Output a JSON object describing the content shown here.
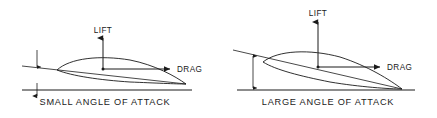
{
  "figure": {
    "background_color": "#ffffff",
    "ink_color": "#1a1a1a",
    "width": 437,
    "height": 118
  },
  "panels": [
    {
      "id": "small-angle",
      "caption": "SMALL ANGLE OF ATTACK",
      "lift_label": "LIFT",
      "drag_label": "DRAG",
      "angle_magnitude": "small",
      "airfoil": {
        "leading_edge": [
          57,
          70
        ],
        "trailing_edge": [
          186,
          84
        ],
        "chord_line_start": [
          22,
          66
        ],
        "chord_line_end": [
          186,
          84
        ],
        "upper_surface_path": "M57,70 C70,58 100,55 130,60 C155,65 175,76 186,84",
        "lower_surface_path": "M57,70 C72,76 100,80 130,82 C155,83 176,84 186,84"
      },
      "center_of_pressure": [
        103,
        69
      ],
      "lift_arrow": {
        "from": [
          103,
          69
        ],
        "to": [
          103,
          36
        ]
      },
      "drag_arrow": {
        "from": [
          103,
          69
        ],
        "to": [
          172,
          69
        ]
      },
      "reference_line": {
        "from": [
          22,
          90
        ],
        "to": [
          192,
          90
        ]
      },
      "angle_indicator": {
        "from": [
          37,
          52
        ],
        "to": [
          37,
          68
        ]
      },
      "caption_anchor": [
        105,
        104
      ],
      "lift_label_anchor": [
        103,
        32
      ],
      "drag_label_anchor": [
        176,
        71
      ]
    },
    {
      "id": "large-angle",
      "caption": "LARGE ANGLE OF ATTACK",
      "lift_label": "LIFT",
      "drag_label": "DRAG",
      "angle_magnitude": "large",
      "airfoil": {
        "leading_edge": [
          263,
          62
        ],
        "trailing_edge": [
          402,
          89
        ],
        "chord_line_start": [
          233,
          50
        ],
        "chord_line_end": [
          402,
          89
        ],
        "upper_surface_path": "M263,62 C278,50 310,49 340,57 C368,66 390,80 402,89",
        "lower_surface_path": "M263,62 C276,70 300,76 330,82 C360,87 390,89 402,89"
      },
      "center_of_pressure": [
        318,
        67
      ],
      "lift_arrow": {
        "from": [
          318,
          67
        ],
        "to": [
          318,
          20
        ]
      },
      "drag_arrow": {
        "from": [
          318,
          67
        ],
        "to": [
          382,
          67
        ]
      },
      "reference_line": {
        "from": [
          237,
          90
        ],
        "to": [
          415,
          90
        ]
      },
      "angle_indicator": {
        "from": [
          253,
          58
        ],
        "to": [
          253,
          88
        ]
      },
      "caption_anchor": [
        328,
        104
      ],
      "lift_label_anchor": [
        318,
        14
      ],
      "drag_label_anchor": [
        386,
        69
      ]
    }
  ]
}
